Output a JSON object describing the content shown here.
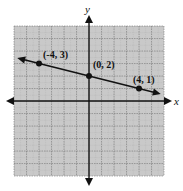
{
  "chart_data": {
    "type": "line",
    "title": "",
    "xlabel": "x",
    "ylabel": "y",
    "xlim": [
      -6,
      6
    ],
    "ylim": [
      -6,
      6
    ],
    "grid": true,
    "grid_minor": true,
    "line": {
      "slope": -0.25,
      "intercept": 2,
      "arrows_both_ends": true
    },
    "points": [
      {
        "x": -4,
        "y": 3,
        "label": "(-4, 3)"
      },
      {
        "x": 0,
        "y": 2,
        "label": "(0, 2)"
      },
      {
        "x": 4,
        "y": 1,
        "label": "(4, 1)"
      }
    ],
    "series": [
      {
        "name": "line",
        "x": [
          -4,
          0,
          4
        ],
        "values": [
          3,
          2,
          1
        ]
      }
    ]
  },
  "axes": {
    "x_label": "x",
    "y_label": "y"
  },
  "colors": {
    "grid_bg": "#c8c8c8",
    "grid_line": "#8a8a8a",
    "axis": "#111111",
    "line": "#111111"
  }
}
